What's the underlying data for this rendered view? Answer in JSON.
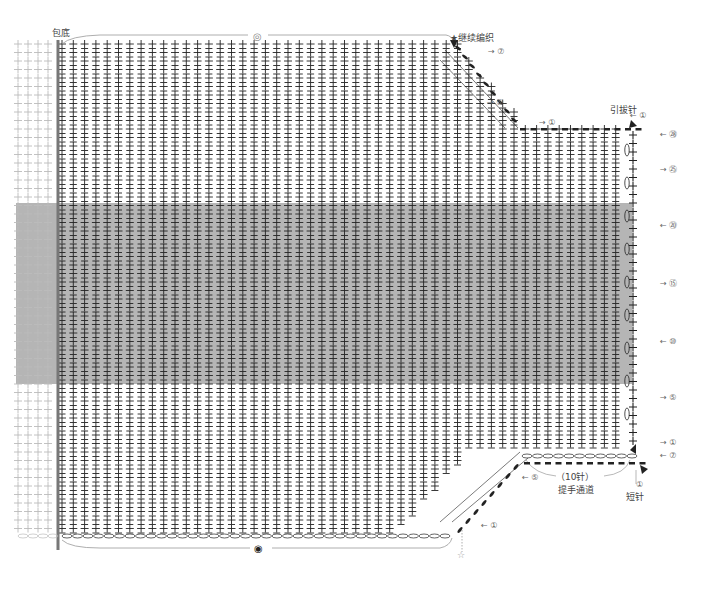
{
  "diagram": {
    "type": "crochet_chart",
    "colors": {
      "band": "#a8a8a8",
      "stitch": "#222222",
      "faint": "#bbbbbb",
      "spine": "#777777",
      "line": "#999999"
    },
    "grid": {
      "x0": 62,
      "dx": 11.3,
      "y0": 44,
      "dy": 8.5,
      "main_cols": 50,
      "rows": 58,
      "faint_cols": 4,
      "faint_x0": 18,
      "band": {
        "y_top": 203,
        "y_bottom": 384
      },
      "spine_x": 58
    },
    "labels": {
      "bottom_edge": "包底",
      "continue": "★继续编织",
      "slip_stitch": "引拔针",
      "handle_gap": "提手通道",
      "stitch_count": "（10针）",
      "single_crochet": "短针",
      "start_marker_top": "◎",
      "start_marker_bottom": "◉",
      "star_open": "☆"
    },
    "row_markers": [
      {
        "text": "⑦",
        "x": 488,
        "y": 52,
        "dir": "right"
      },
      {
        "text": "⑤",
        "x": 487,
        "y": 103,
        "dir": "right"
      },
      {
        "text": "①",
        "x": 539,
        "y": 123,
        "dir": "right"
      },
      {
        "text": "①",
        "x": 630,
        "y": 116,
        "dir": "left"
      },
      {
        "text": "㉘",
        "x": 660,
        "y": 135,
        "dir": "left"
      },
      {
        "text": "㉕",
        "x": 660,
        "y": 170,
        "dir": "right"
      },
      {
        "text": "⑳",
        "x": 660,
        "y": 226,
        "dir": "left"
      },
      {
        "text": "⑮",
        "x": 660,
        "y": 284,
        "dir": "right"
      },
      {
        "text": "⑩",
        "x": 660,
        "y": 342,
        "dir": "left"
      },
      {
        "text": "⑤",
        "x": 660,
        "y": 398,
        "dir": "right"
      },
      {
        "text": "①",
        "x": 660,
        "y": 443,
        "dir": "right"
      },
      {
        "text": "⑦",
        "x": 660,
        "y": 456,
        "dir": "left"
      },
      {
        "text": "⑤",
        "x": 522,
        "y": 478,
        "dir": "left"
      },
      {
        "text": "①",
        "x": 481,
        "y": 526,
        "dir": "left"
      },
      {
        "text": "①",
        "x": 636,
        "y": 485,
        "dir": "up"
      }
    ]
  }
}
